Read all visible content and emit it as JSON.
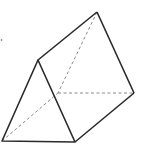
{
  "diagram": {
    "type": "triangular-prism",
    "stroke_color": "#2a2a2a",
    "hidden_color": "#8a8a8a",
    "vertices": {
      "front_top": [
        38,
        60
      ],
      "front_bottom_left": [
        2,
        141
      ],
      "front_bottom_right": [
        75,
        142
      ],
      "back_top": [
        97,
        12
      ],
      "back_bottom_left": [
        58,
        93
      ],
      "back_bottom_right": [
        134,
        93
      ]
    }
  }
}
